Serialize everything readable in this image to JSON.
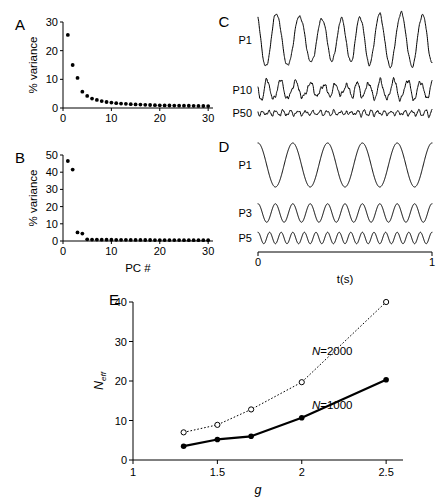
{
  "figure": {
    "width": 439,
    "height": 500,
    "background": "#ffffff",
    "ink": "#000000"
  },
  "panels": {
    "a": {
      "letter": "A"
    },
    "b": {
      "letter": "B"
    },
    "c": {
      "letter": "C"
    },
    "d": {
      "letter": "D"
    },
    "e": {
      "letter": "E"
    }
  },
  "chart_data": [
    {
      "id": "panel-a",
      "type": "scatter",
      "title": "",
      "panel_letter": "A",
      "xlabel": "",
      "ylabel": "% variance",
      "xlim": [
        0,
        31
      ],
      "ylim": [
        0,
        30
      ],
      "xticks": [
        0,
        10,
        20,
        30
      ],
      "xticklabels": [
        "0",
        "10",
        "20",
        "30"
      ],
      "yticks": [
        0,
        10,
        20,
        30
      ],
      "yticklabels": [
        "0",
        "10",
        "20",
        "30"
      ],
      "grid": false,
      "marker": "filled-circle",
      "x": [
        1,
        2,
        3,
        4,
        5,
        6,
        7,
        8,
        9,
        10,
        11,
        12,
        13,
        14,
        15,
        16,
        17,
        18,
        19,
        20,
        21,
        22,
        23,
        24,
        25,
        26,
        27,
        28,
        29,
        30
      ],
      "values": [
        25.5,
        15.0,
        10.5,
        5.7,
        4.2,
        3.3,
        2.8,
        2.4,
        2.1,
        1.9,
        1.7,
        1.55,
        1.45,
        1.35,
        1.25,
        1.2,
        1.1,
        1.05,
        1.0,
        0.95,
        0.9,
        0.88,
        0.85,
        0.82,
        0.8,
        0.78,
        0.75,
        0.72,
        0.7,
        0.68
      ]
    },
    {
      "id": "panel-b",
      "type": "scatter",
      "title": "",
      "panel_letter": "B",
      "xlabel": "PC #",
      "ylabel": "% variance",
      "xlim": [
        0,
        31
      ],
      "ylim": [
        0,
        50
      ],
      "xticks": [
        0,
        10,
        20,
        30
      ],
      "xticklabels": [
        "0",
        "10",
        "20",
        "30"
      ],
      "yticks": [
        0,
        10,
        20,
        30,
        40,
        50
      ],
      "yticklabels": [
        "0",
        "10",
        "20",
        "30",
        "40",
        "50"
      ],
      "grid": false,
      "marker": "filled-circle",
      "x": [
        1,
        2,
        3,
        4,
        5,
        6,
        7,
        8,
        9,
        10,
        11,
        12,
        13,
        14,
        15,
        16,
        17,
        18,
        19,
        20,
        21,
        22,
        23,
        24,
        25,
        26,
        27,
        28,
        29,
        30
      ],
      "values": [
        46.5,
        41.5,
        5.0,
        4.3,
        1.0,
        0.85,
        0.8,
        0.78,
        0.75,
        0.72,
        0.7,
        0.68,
        0.66,
        0.64,
        0.62,
        0.6,
        0.58,
        0.57,
        0.56,
        0.55,
        0.54,
        0.53,
        0.52,
        0.51,
        0.5,
        0.49,
        0.48,
        0.47,
        0.46,
        0.45
      ]
    },
    {
      "id": "panel-c",
      "type": "line",
      "title": "",
      "panel_letter": "C",
      "xlabel": "",
      "ylabel": "",
      "grid": false,
      "series": [
        {
          "name": "P1",
          "label": "P1",
          "kind": "noisy-oscillation",
          "amplitude": 1.0,
          "cycles": 8.5,
          "noise": 0.07,
          "irregular": 0.35
        },
        {
          "name": "P10",
          "label": "P10",
          "kind": "noisy-oscillation",
          "amplitude": 0.32,
          "cycles": 14,
          "noise": 0.35,
          "irregular": 0.8
        },
        {
          "name": "P50",
          "label": "P50",
          "kind": "noisy-oscillation",
          "amplitude": 0.09,
          "cycles": 26,
          "noise": 0.9,
          "irregular": 1.0
        }
      ]
    },
    {
      "id": "panel-d",
      "type": "line",
      "title": "",
      "panel_letter": "D",
      "xlabel": "t(s)",
      "xlim": [
        0,
        1
      ],
      "xticks": [
        0,
        1
      ],
      "xticklabels": [
        "0",
        "1"
      ],
      "grid": false,
      "series": [
        {
          "name": "P1",
          "label": "P1",
          "kind": "sine",
          "amplitude": 1.0,
          "cycles": 5
        },
        {
          "name": "P3",
          "label": "P3",
          "kind": "sine",
          "amplitude": 0.42,
          "cycles": 10
        },
        {
          "name": "P5",
          "label": "P5",
          "kind": "sine",
          "amplitude": 0.26,
          "cycles": 15
        }
      ]
    },
    {
      "id": "panel-e",
      "type": "line",
      "title": "",
      "panel_letter": "E",
      "xlabel": "g",
      "ylabel": "Neff",
      "ylabel_base": "N",
      "ylabel_sub": "eff",
      "xlim": [
        1,
        2.6
      ],
      "ylim": [
        0,
        40
      ],
      "xticks": [
        1,
        1.5,
        2,
        2.5
      ],
      "xticklabels": [
        "1",
        "1.5",
        "2",
        "2.5"
      ],
      "yticks": [
        0,
        10,
        20,
        30,
        40
      ],
      "yticklabels": [
        "0",
        "10",
        "20",
        "30",
        "40"
      ],
      "grid": false,
      "x": [
        1.3,
        1.5,
        1.7,
        2.0,
        2.5
      ],
      "series": [
        {
          "name": "N=2000",
          "label_prefix": "N",
          "label_suffix": "=2000",
          "values": [
            7.0,
            8.9,
            12.8,
            19.7,
            40.0
          ],
          "marker": "open-circle",
          "linestyle": "dotted",
          "linewidth": 1,
          "color": "#000000",
          "label_x": 2.06,
          "label_y": 26.5
        },
        {
          "name": "N=1000",
          "label_prefix": "N",
          "label_suffix": "=1000",
          "values": [
            3.5,
            5.2,
            6.0,
            10.7,
            20.3
          ],
          "marker": "filled-circle",
          "linestyle": "solid",
          "linewidth": 2.2,
          "color": "#000000",
          "label_x": 2.06,
          "label_y": 13.0
        }
      ]
    }
  ]
}
